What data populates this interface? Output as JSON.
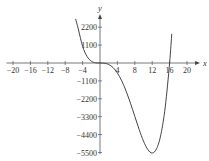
{
  "chart_data": {
    "type": "line",
    "title": "",
    "xlabel": "x",
    "ylabel": "y",
    "xlim": [
      -21.5,
      23
    ],
    "ylim": [
      -5600,
      2700
    ],
    "x_ticks": [
      -20,
      -16,
      -12,
      -8,
      -4,
      4,
      8,
      12,
      16,
      20
    ],
    "x_tick_labels": [
      "−20",
      "−16",
      "−12",
      "−8",
      "−4",
      "4",
      "8",
      "12",
      "16",
      "20"
    ],
    "y_ticks": [
      2200,
      1100,
      -1100,
      -2200,
      -3300,
      -4400,
      -5500
    ],
    "y_tick_labels": [
      "2200",
      "1100",
      "−1100",
      "−2200",
      "−3300",
      "−4400",
      "−5500"
    ],
    "grid": false,
    "series": [
      {
        "name": "f(x)",
        "description": "quartic with triple root at x=0 and root at x=16, minimum near x=12",
        "x": [
          -5.6,
          -5,
          -4,
          -3,
          -2,
          -1,
          0,
          1,
          2,
          3,
          4,
          5,
          6,
          7,
          8,
          9,
          10,
          11,
          12,
          13,
          14,
          15,
          16,
          16.5
        ],
        "y": [
          2707,
          2100,
          1024,
          410,
          115,
          14,
          0,
          -12,
          -90,
          -281,
          -614,
          -1100,
          -1728,
          -2470,
          -3277,
          -4082,
          -4800,
          -5324,
          -5530,
          -5273,
          -4390,
          -2700,
          0,
          1797
        ]
      }
    ]
  }
}
